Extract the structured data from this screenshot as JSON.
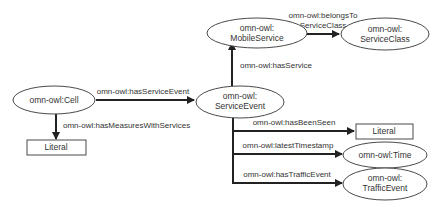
{
  "diagram": {
    "type": "ontology-graph",
    "colors": {
      "background": "#ffffff",
      "node_stroke": "#4a4a4a",
      "edge": "#222222",
      "text": "#333333"
    },
    "nodes": {
      "mobile_service": {
        "shape": "ellipse",
        "line1": "omn-owl:",
        "line2": "MobileService"
      },
      "service_class": {
        "shape": "ellipse",
        "line1": "omn-owl:",
        "line2": "ServiceClass"
      },
      "cell": {
        "shape": "ellipse",
        "label": "omn-owl:Cell"
      },
      "service_event": {
        "shape": "ellipse",
        "line1": "omn-owl:",
        "line2": "ServiceEvent"
      },
      "literal_left": {
        "shape": "rectangle",
        "label": "Literal"
      },
      "literal_right": {
        "shape": "rectangle",
        "label": "Literal"
      },
      "time": {
        "shape": "ellipse",
        "label": "omn-owl:Time"
      },
      "traffic_event": {
        "shape": "ellipse",
        "line1": "omn-owl:",
        "line2": "TrafficEvent"
      }
    },
    "edges": {
      "belongs_to_service_class": {
        "from": "MobileService",
        "to": "ServiceClass",
        "line1": "omn-owl:belongsTo",
        "line2": "ServiceClass"
      },
      "has_service": {
        "from": "ServiceEvent",
        "to": "MobileService",
        "label": "omn-owl:hasService"
      },
      "has_service_event": {
        "from": "Cell",
        "to": "ServiceEvent",
        "label": "omn-owl:hasServiceEvent"
      },
      "has_measures_with_services": {
        "from": "Cell",
        "to": "Literal",
        "label": "omn-owl:hasMeasuresWithServices"
      },
      "has_been_seen": {
        "from": "ServiceEvent",
        "to": "Literal",
        "label": "omn-owl:hasBeenSeen"
      },
      "latest_timestamp": {
        "from": "ServiceEvent",
        "to": "Time",
        "label": "omn-owl:latestTimestamp"
      },
      "has_traffic_event": {
        "from": "ServiceEvent",
        "to": "TrafficEvent",
        "label": "omn-owl:hasTrafficEvent"
      }
    }
  }
}
